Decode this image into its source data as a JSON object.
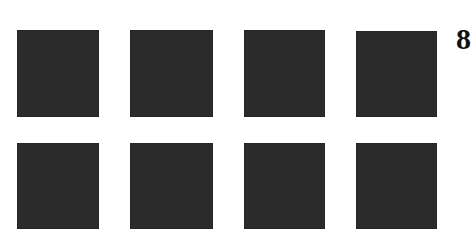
{
  "grid": {
    "rows": 2,
    "cols": 4,
    "square_color": "#2b2b2b",
    "background_color": "#ffffff",
    "squares": [
      {
        "row": 1,
        "col": 1,
        "x": 17,
        "y": 30,
        "w": 82,
        "h": 87
      },
      {
        "row": 1,
        "col": 2,
        "x": 130,
        "y": 30,
        "w": 83,
        "h": 87
      },
      {
        "row": 1,
        "col": 3,
        "x": 244,
        "y": 30,
        "w": 81,
        "h": 87
      },
      {
        "row": 1,
        "col": 4,
        "x": 356,
        "y": 31,
        "w": 81,
        "h": 86
      },
      {
        "row": 2,
        "col": 1,
        "x": 17,
        "y": 143,
        "w": 82,
        "h": 86
      },
      {
        "row": 2,
        "col": 2,
        "x": 130,
        "y": 143,
        "w": 83,
        "h": 86
      },
      {
        "row": 2,
        "col": 3,
        "x": 244,
        "y": 143,
        "w": 81,
        "h": 86
      },
      {
        "row": 2,
        "col": 4,
        "x": 356,
        "y": 143,
        "w": 81,
        "h": 86
      }
    ]
  },
  "label": {
    "text": "8"
  }
}
